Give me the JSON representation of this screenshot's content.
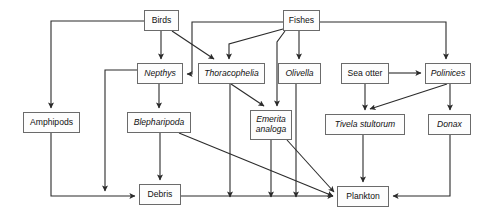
{
  "diagram": {
    "type": "food-web-flowchart",
    "style": {
      "box_fill": "#fdfdfd",
      "box_border": "#6b6b6b",
      "edge_color": "#2b2b2b",
      "text_color": "#111111",
      "background": "#ffffff"
    },
    "nodes": [
      {
        "id": "birds",
        "label": "Birds",
        "italic": false,
        "x": 144,
        "y": 10,
        "w": 35,
        "h": 21
      },
      {
        "id": "fishes",
        "label": "Fishes",
        "italic": false,
        "x": 283,
        "y": 10,
        "w": 37,
        "h": 21
      },
      {
        "id": "nepthys",
        "label": "Nepthys",
        "italic": true,
        "x": 137,
        "y": 63,
        "w": 46,
        "h": 21
      },
      {
        "id": "thoracophelia",
        "label": "Thoracophelia",
        "italic": true,
        "x": 198,
        "y": 63,
        "w": 67,
        "h": 21
      },
      {
        "id": "olivella",
        "label": "Olivella",
        "italic": true,
        "x": 278,
        "y": 63,
        "w": 43,
        "h": 21
      },
      {
        "id": "seaotter",
        "label": "Sea otter",
        "italic": false,
        "x": 341,
        "y": 63,
        "w": 48,
        "h": 21
      },
      {
        "id": "polinices",
        "label": "Polinices",
        "italic": true,
        "x": 425,
        "y": 63,
        "w": 46,
        "h": 21
      },
      {
        "id": "amphipods",
        "label": "Amphipods",
        "italic": false,
        "x": 23,
        "y": 112,
        "w": 57,
        "h": 21
      },
      {
        "id": "blepharipoda",
        "label": "Blepharipoda",
        "italic": true,
        "x": 127,
        "y": 112,
        "w": 64,
        "h": 21
      },
      {
        "id": "emerita",
        "label": "Emerita\nanaloga",
        "italic": true,
        "x": 250,
        "y": 110,
        "w": 42,
        "h": 30
      },
      {
        "id": "tivela",
        "label": "Tivela stultorum",
        "italic": true,
        "x": 325,
        "y": 114,
        "w": 80,
        "h": 21
      },
      {
        "id": "donax",
        "label": "Donax",
        "italic": true,
        "x": 428,
        "y": 114,
        "w": 43,
        "h": 21
      },
      {
        "id": "debris",
        "label": "Debris",
        "italic": false,
        "x": 139,
        "y": 184,
        "w": 42,
        "h": 21
      },
      {
        "id": "plankton",
        "label": "Plankton",
        "italic": false,
        "x": 337,
        "y": 186,
        "w": 52,
        "h": 21
      }
    ],
    "edges": [
      {
        "from": "birds",
        "to": "amphipods",
        "name": "edge-birds-amphipods",
        "path": "M144,21 L51,21 L51,108",
        "arrow": "down"
      },
      {
        "from": "birds",
        "to": "nepthys",
        "name": "edge-birds-nepthys",
        "path": "M161,31 L161,59",
        "arrow": "down"
      },
      {
        "from": "birds",
        "to": "thoracophelia",
        "name": "edge-birds-thoracophelia",
        "path": "M172,31 L214,59",
        "arrow": "diag"
      },
      {
        "from": "fishes",
        "to": "nepthys",
        "name": "edge-fishes-nepthys",
        "path": "M283,22 L192,22 L192,74 L187,74",
        "arrow": "left"
      },
      {
        "from": "fishes",
        "to": "thoracophelia",
        "name": "edge-fishes-thoracophelia",
        "path": "M283,29 L229,44 L229,59",
        "arrow": "down"
      },
      {
        "from": "fishes",
        "to": "olivella",
        "name": "edge-fishes-olivella",
        "path": "M299,31 L299,59",
        "arrow": "down"
      },
      {
        "from": "fishes",
        "to": "emerita",
        "name": "edge-fishes-emerita",
        "path": "M285,31 L277,42 L277,68 L277,106",
        "arrow": "down"
      },
      {
        "from": "fishes",
        "to": "polinices",
        "name": "edge-fishes-polinices",
        "path": "M320,22 L446,22 L446,59",
        "arrow": "down"
      },
      {
        "from": "nepthys",
        "to": "blepharipoda",
        "name": "edge-nepthys-blepharipoda",
        "path": "M159,84 L159,108",
        "arrow": "down"
      },
      {
        "from": "nepthys",
        "to": "debris",
        "name": "edge-nepthys-debris",
        "path": "M137,70 L105,70 L105,191",
        "arrow": "down"
      },
      {
        "from": "thoracophelia",
        "to": "emerita",
        "name": "edge-thoracophelia-emerita",
        "path": "M231,84 L264,106",
        "arrow": "diag"
      },
      {
        "from": "thoracophelia",
        "to": "debris-line",
        "name": "edge-thoracophelia-bottom",
        "path": "M230,84 L230,197",
        "arrow": "down"
      },
      {
        "from": "olivella",
        "to": "plankton",
        "name": "edge-olivella-plankton",
        "path": "M296,84 L296,197",
        "arrow": "down"
      },
      {
        "from": "emerita",
        "to": "bottom",
        "name": "edge-emerita-bottom",
        "path": "M271,140 L271,197",
        "arrow": "down"
      },
      {
        "from": "emerita",
        "to": "plankton",
        "name": "edge-emerita-plankton",
        "path": "M287,140 L334,192",
        "arrow": "diag"
      },
      {
        "from": "seaotter",
        "to": "polinices",
        "name": "edge-seaotter-polinices",
        "path": "M389,73 L421,73",
        "arrow": "right"
      },
      {
        "from": "seaotter",
        "to": "tivela",
        "name": "edge-seaotter-tivela",
        "path": "M365,84 L365,110",
        "arrow": "down"
      },
      {
        "from": "polinices",
        "to": "tivela",
        "name": "edge-polinices-tivela",
        "path": "M447,84 L370,109",
        "arrow": "diag"
      },
      {
        "from": "polinices",
        "to": "donax",
        "name": "edge-polinices-donax",
        "path": "M450,84 L450,110",
        "arrow": "down"
      },
      {
        "from": "amphipods",
        "to": "debris",
        "name": "edge-amphipods-debris",
        "path": "M51,133 L51,196 L135,196",
        "arrow": "right"
      },
      {
        "from": "blepharipoda",
        "to": "debris",
        "name": "edge-blepharipoda-debris",
        "path": "M160,133 L160,180",
        "arrow": "down"
      },
      {
        "from": "blepharipoda",
        "to": "plankton",
        "name": "edge-blepharipoda-plankton",
        "path": "M179,133 L333,196",
        "arrow": "diag"
      },
      {
        "from": "tivela",
        "to": "plankton",
        "name": "edge-tivela-plankton",
        "path": "M363,135 L363,182",
        "arrow": "down"
      },
      {
        "from": "donax",
        "to": "plankton",
        "name": "edge-donax-plankton",
        "path": "M450,135 L450,196 L393,196",
        "arrow": "left"
      },
      {
        "from": "debris",
        "to": "bottom-rail",
        "name": "edge-debris-rail",
        "path": "M181,196 L333,196",
        "arrow": "right"
      }
    ]
  }
}
